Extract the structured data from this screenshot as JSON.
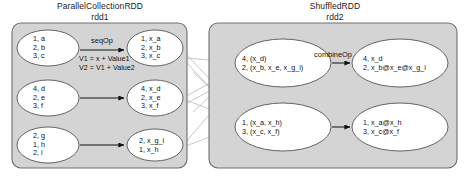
{
  "panels": [
    {
      "id": "rdd1",
      "title_line1": "ParallelCollectionRDD",
      "title_line2": "rdd1",
      "fill": "#d4d4d4",
      "stroke": "#6e6e6e"
    },
    {
      "id": "rdd2",
      "title_line1": "ShuffledRDD",
      "title_line2": "rdd2",
      "fill": "#d4d4d4",
      "stroke": "#6e6e6e"
    }
  ],
  "nodes": {
    "rdd1_in_1": [
      "1, a",
      "2, b",
      "3, c"
    ],
    "rdd1_in_2": [
      "4, d",
      "2, e",
      "3, f"
    ],
    "rdd1_in_3": [
      "2, g",
      "1, h",
      "2, i"
    ],
    "rdd1_out_1": [
      "1, x_a",
      "2, x_b",
      "3, x_c"
    ],
    "rdd1_out_2": [
      "4, x_d",
      "2, x_e",
      "3, x_f"
    ],
    "rdd1_out_3": [
      "2, x_g_i",
      "1, x_h"
    ],
    "rdd2_in_1": [
      "4, (x_d)",
      "2, (x_b, x_e, x_g_i)"
    ],
    "rdd2_in_2": [
      "1, (x_a, x_h)",
      "3, (x_c, x_f)"
    ],
    "rdd2_out_1": [
      "4, x_d",
      "2, x_b@x_e@x_g_i"
    ],
    "rdd2_out_2": [
      "1, x_a@x_h",
      "3, x_c@x_f"
    ]
  },
  "edges": {
    "seq_op_label": "seqOp",
    "combine_op_label": "combineOp",
    "formula_line1": "V1 = x + Value1",
    "formula_line2": "V2 = V1 + Value2"
  },
  "colors": {
    "panel_fill": "#d4d4d4",
    "panel_stroke": "#6e6e6e",
    "node_fill": "#ffffff",
    "node_stroke": "#555555",
    "arrow": "#111111",
    "shuffle_line": "#b0b0b0",
    "text": "#111111",
    "background": "#ffffff"
  }
}
